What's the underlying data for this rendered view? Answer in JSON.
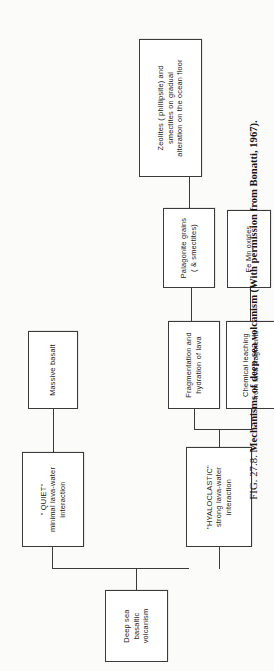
{
  "figure": {
    "caption_label": "FIG. 27.8.",
    "caption_body": "Mechanisms of deep-sea volcanism (With permission from Bonatti, 1967).",
    "orientation": "rotated-90-ccw",
    "accent_color": "#3a3a3a",
    "background_color": "#fbfbfa",
    "box_fill_color": "#ffffff"
  },
  "diagram": {
    "type": "flowchart",
    "nodes": {
      "source": "Deep sea\nbasaltic\nvolcanism",
      "quiet": "\" QUIET\"\nminimal lava-water\ninteraction",
      "hyaloclastic": "\"HYALOCLASTIC\"\nstrong lava-water\ninteraction",
      "massive_basalt": "Massive basalt",
      "fragmentation": "Fragmentation and\nhydration  of  lava",
      "chemical_leaching": "Chemical leaching\nfrom lava fragments",
      "palagonite": "Palagonite grains\n( & smectites)",
      "fe_mn_oxides": "Fe Mn oxides",
      "zeolites": "Zeolites ( phillipsite) and\nsmectites on gradual\nalteration on the ocean floor"
    },
    "edges": [
      {
        "from": "source",
        "to": "quiet"
      },
      {
        "from": "source",
        "to": "hyaloclastic"
      },
      {
        "from": "quiet",
        "to": "massive_basalt"
      },
      {
        "from": "hyaloclastic",
        "to": "fragmentation"
      },
      {
        "from": "hyaloclastic",
        "to": "chemical_leaching"
      },
      {
        "from": "fragmentation",
        "to": "palagonite"
      },
      {
        "from": "chemical_leaching",
        "to": "fe_mn_oxides"
      },
      {
        "from": "palagonite",
        "to": "zeolites"
      }
    ]
  }
}
